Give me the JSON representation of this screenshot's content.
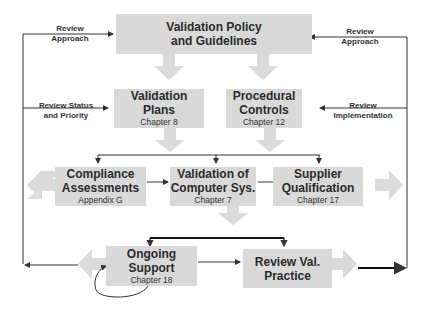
{
  "diagram": {
    "boxes": {
      "policy": {
        "title1": "Validation Policy",
        "title2": "and Guidelines"
      },
      "plans": {
        "title1": "Validation Plans",
        "subtitle": "Chapter 8"
      },
      "controls": {
        "title1": "Procedural",
        "title2": "Controls",
        "subtitle": "Chapter 12"
      },
      "compliance": {
        "title1": "Compliance",
        "title2": "Assessments",
        "subtitle": "Appendix G"
      },
      "computer": {
        "title1": "Validation of",
        "title2": "Computer Sys.",
        "subtitle": "Chapter 7"
      },
      "supplier": {
        "title1": "Supplier",
        "title2": "Qualification",
        "subtitle": "Chapter 17"
      },
      "support": {
        "title1": "Ongoing",
        "title2": "Support",
        "subtitle": "Chapter 18"
      },
      "practice": {
        "title1": "Review Val.",
        "title2": "Practice"
      }
    },
    "labels": {
      "review_approach_left": {
        "line1": "Review",
        "line2": "Approach"
      },
      "review_status": {
        "line1": "Review Status",
        "line2": "and Priority"
      },
      "review_approach_right": {
        "line1": "Review",
        "line2": "Approach"
      },
      "review_implementation": {
        "line1": "Review",
        "line2": "Implementation"
      }
    },
    "colors": {
      "box": "#d9d9d9",
      "arrow": "#dadada",
      "line": "#333333"
    }
  }
}
